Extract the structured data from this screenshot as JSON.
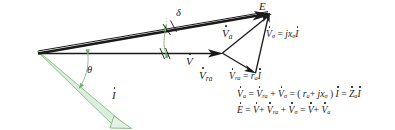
{
  "figure": {
    "type": "phasor-diagram",
    "background": "#ffffff",
    "stroke_color": "#1a1a1a",
    "current_color": "#7fbf7f",
    "current_fill": "#d8ecd8"
  },
  "labels": {
    "emf": "E",
    "terminal_voltage": "V",
    "armature_voltage": "V",
    "armature_voltage_sub": "a",
    "resistance_drop": "V",
    "resistance_drop_sub": "ra",
    "reactance_drop": "V",
    "reactance_drop_sub": "a",
    "current": "I",
    "angle_delta": "δ",
    "angle_theta": "θ"
  },
  "equations": [
    {
      "id": "eq-reactance-drop",
      "text": "V̇σ = jxσ İ",
      "parts": [
        "V",
        "σ",
        "=",
        "j",
        "x",
        "σ",
        "I"
      ]
    },
    {
      "id": "eq-resistance-drop",
      "text": "V̇ra = ra İ",
      "parts": [
        "V",
        "ra",
        "=",
        "r",
        "a",
        "I"
      ]
    },
    {
      "id": "eq-armature-voltage",
      "text": "V̇a = V̇ra + V̇σ = ( ra + jxσ ) İ = Żaİ",
      "parts": [
        "V",
        "a",
        "=",
        "V",
        "ra",
        "+",
        "V",
        "σ",
        "=",
        "(",
        "r",
        "a",
        "+",
        "j",
        "x",
        "σ",
        ")",
        "I",
        "=",
        "Z",
        "a",
        "I"
      ]
    },
    {
      "id": "eq-emf",
      "text": "Ė = V̇ + V̇ra + V̇σ = V̇ + V̇a",
      "parts": [
        "E",
        "=",
        "V",
        "+",
        "V",
        "ra",
        "+",
        "V",
        "σ",
        "=",
        "V",
        "+",
        "V",
        "a"
      ]
    }
  ],
  "geometry": {
    "origin": [
      38,
      53
    ],
    "emf_tip": [
      270,
      13
    ],
    "terminal_tip": [
      222,
      53
    ],
    "ra_tip": [
      255,
      73
    ],
    "current_tip": [
      120,
      122
    ],
    "delta_arc_x": 166,
    "theta_arc_x": 88
  }
}
